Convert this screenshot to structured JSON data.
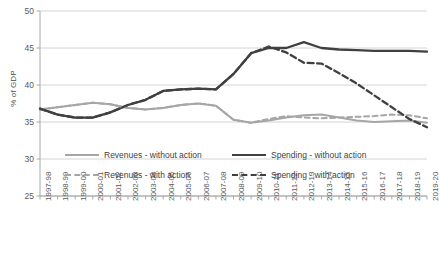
{
  "chart_data": {
    "type": "line",
    "title": "",
    "xlabel": "",
    "ylabel": "% of GDP",
    "ylim": [
      25,
      50
    ],
    "yticks": [
      25,
      30,
      35,
      40,
      45,
      50
    ],
    "grid": true,
    "legend_position": "bottom",
    "categories": [
      "1997-98",
      "1998-99",
      "1999-00",
      "2000-01",
      "2001-02",
      "2002-03",
      "2003-04",
      "2004-05",
      "2005-06",
      "2006-07",
      "2007-08",
      "2008-09",
      "2009-10",
      "2010-11",
      "2011-12",
      "2012-13",
      "2013-14",
      "2014-15",
      "2015-16",
      "2016-17",
      "2017-18",
      "2018-19",
      "2019-20"
    ],
    "series": [
      {
        "name": "Revenues - without action",
        "color": "#a6a6a6",
        "style": "solid",
        "values": [
          36.7,
          37.0,
          37.3,
          37.6,
          37.4,
          36.9,
          36.7,
          36.9,
          37.3,
          37.5,
          37.2,
          35.3,
          34.9,
          35.2,
          35.6,
          35.9,
          36.0,
          35.6,
          35.2,
          35.0,
          35.1,
          35.2,
          34.9
        ]
      },
      {
        "name": "Spending - without action",
        "color": "#404040",
        "style": "solid",
        "values": [
          36.8,
          36.0,
          35.6,
          35.6,
          36.3,
          37.3,
          38.0,
          39.2,
          39.4,
          39.5,
          39.4,
          41.5,
          44.3,
          45.0,
          45.0,
          45.8,
          45.0,
          44.8,
          44.7,
          44.6,
          44.6,
          44.6,
          44.5
        ]
      },
      {
        "name": "Revenues - with action",
        "color": "#a6a6a6",
        "style": "dashed",
        "values": [
          36.7,
          37.0,
          37.3,
          37.6,
          37.4,
          36.9,
          36.7,
          36.9,
          37.3,
          37.5,
          37.2,
          35.3,
          34.9,
          35.4,
          35.8,
          35.6,
          35.5,
          35.6,
          35.7,
          35.8,
          36.0,
          35.9,
          35.5
        ]
      },
      {
        "name": "Spending - with action",
        "color": "#404040",
        "style": "dashed",
        "values": [
          36.8,
          36.0,
          35.6,
          35.6,
          36.3,
          37.3,
          38.0,
          39.2,
          39.4,
          39.5,
          39.4,
          41.5,
          44.3,
          45.2,
          44.4,
          43.0,
          42.9,
          41.6,
          40.2,
          38.6,
          37.0,
          35.4,
          34.3
        ]
      }
    ]
  },
  "legend": {
    "items": [
      {
        "label": "Revenues - without action"
      },
      {
        "label": "Spending - without action"
      },
      {
        "label": "Revenues - with action"
      },
      {
        "label": "Spending - with action"
      }
    ]
  }
}
